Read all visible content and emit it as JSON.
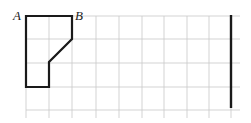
{
  "diagram": {
    "grid": {
      "origin_x": 26,
      "origin_y": 16,
      "cell": 23.2,
      "cols_lines": 10,
      "rows_lines": 5,
      "extend_right": 240,
      "extend_bottom": 118,
      "color": "#c8c8c8"
    },
    "shape": {
      "points": "26,16 72,16 72,39 49,62 49,87 26,87",
      "stroke": "#1a1a1a"
    },
    "vertical_bar": {
      "x": 231,
      "y1": 15,
      "y2": 108,
      "stroke": "#1a1a1a"
    },
    "labels": {
      "a": "A",
      "b": "B"
    }
  }
}
